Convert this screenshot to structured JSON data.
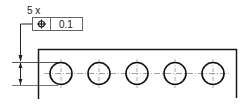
{
  "drawing": {
    "type": "GD&T position tolerance drawing",
    "count_label": "5 x",
    "feature_control_frame": {
      "symbol": "position-symbol",
      "tolerance": "0.1"
    },
    "hole_count": 5,
    "colors": {
      "line": "#1a1a1a",
      "thin_line": "#555555",
      "centerline": "#888888",
      "frame_border": "#666666"
    }
  }
}
